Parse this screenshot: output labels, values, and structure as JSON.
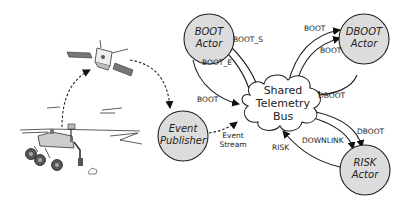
{
  "diagram": {
    "type": "architecture",
    "nodes": {
      "boot_actor": {
        "line1": "BOOT",
        "line2": "Actor"
      },
      "dboot_actor": {
        "line1": "DBOOT",
        "line2": "Actor"
      },
      "risk_actor": {
        "line1": "RISK",
        "line2": "Actor"
      },
      "event_publisher": {
        "line1": "Event",
        "line2": "Publisher"
      },
      "bus": {
        "line1": "Shared",
        "line2": "Telemetry",
        "line3": "Bus"
      }
    },
    "edges": {
      "bus_to_boot_s": "BOOT_S",
      "bus_to_boot_e": "BOOT_E",
      "boot_to_bus": "BOOT",
      "bus_to_dboot_1": "BOOT",
      "bus_to_dboot_2": "BOOT",
      "dboot_to_bus": "DBOOT",
      "bus_to_risk_downlink": "DOWNLINK",
      "bus_to_risk_dboot": "DBOOT",
      "risk_to_bus": "RISK",
      "publisher_to_bus_line1": "Event",
      "publisher_to_bus_line2": "Stream"
    },
    "illustrations": [
      "rover",
      "orbiter-satellite"
    ],
    "colors": {
      "node_fill": "#dcdcdc",
      "stroke": "#222222",
      "background": "#ffffff"
    }
  }
}
